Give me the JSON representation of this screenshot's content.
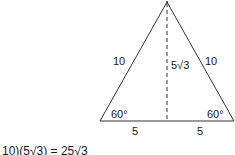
{
  "diagram": {
    "type": "equilateral-triangle",
    "side_left_label": "10",
    "side_right_label": "10",
    "height_label": "5√3",
    "angle_left_label": "60°",
    "angle_right_label": "60°",
    "base_left_label": "5",
    "base_right_label": "5",
    "colors": {
      "stroke": "#333333",
      "text": "#1a1a1a"
    }
  },
  "formula": {
    "text": "10)(5√3) = 25√3"
  }
}
